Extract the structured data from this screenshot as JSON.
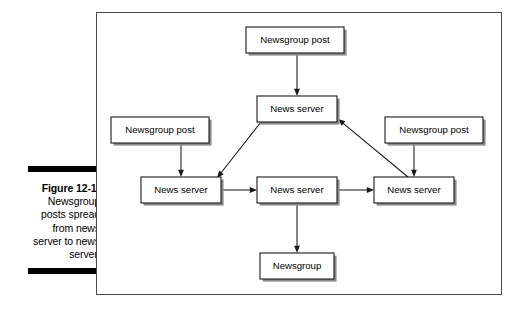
{
  "page": {
    "background_color": "#ffffff",
    "ink_color": "#000000"
  },
  "caption": {
    "figure_number": "Figure 12-1:",
    "body": "Newsgroup posts spread from news server to news server.",
    "rule_color": "#000000"
  },
  "figure": {
    "frame_border_color": "#4a4a4a",
    "box_fill": "#ffffff",
    "box_border_color": "#1a1a1a",
    "box_shadow_color": "#8c8c8c",
    "edge_color": "#1a1a1a"
  },
  "diagram": {
    "type": "flow-diagram",
    "nodes": [
      {
        "id": "post-top",
        "label": "Newsgroup post",
        "x": 149,
        "y": 14,
        "w": 98,
        "h": 26
      },
      {
        "id": "server-top",
        "label": "News server",
        "x": 160,
        "y": 83,
        "w": 80,
        "h": 26
      },
      {
        "id": "post-left",
        "label": "Newsgroup post",
        "x": 14,
        "y": 104,
        "w": 98,
        "h": 26
      },
      {
        "id": "post-right",
        "label": "Newsgroup post",
        "x": 288,
        "y": 104,
        "w": 98,
        "h": 26
      },
      {
        "id": "server-left",
        "label": "News server",
        "x": 44,
        "y": 164,
        "w": 80,
        "h": 26
      },
      {
        "id": "server-middle",
        "label": "News server",
        "x": 160,
        "y": 164,
        "w": 80,
        "h": 26
      },
      {
        "id": "server-right",
        "label": "News server",
        "x": 277,
        "y": 164,
        "w": 80,
        "h": 26
      },
      {
        "id": "newsgroup",
        "label": "Newsgroup",
        "x": 163,
        "y": 240,
        "w": 74,
        "h": 26
      }
    ],
    "edges": [
      {
        "id": "post-top-to-server-top",
        "from": "post-top",
        "to": "server-top",
        "kind": "vertical"
      },
      {
        "id": "post-left-to-server-left",
        "from": "post-left",
        "to": "server-left",
        "kind": "vertical"
      },
      {
        "id": "post-right-to-server-right",
        "from": "post-right",
        "to": "server-right",
        "kind": "vertical"
      },
      {
        "id": "server-top-to-server-left",
        "from": "server-top",
        "to": "server-left",
        "kind": "diagonal"
      },
      {
        "id": "server-right-to-server-top",
        "from": "server-right",
        "to": "server-top",
        "kind": "diagonal"
      },
      {
        "id": "server-left-to-server-middle",
        "from": "server-left",
        "to": "server-middle",
        "kind": "horizontal"
      },
      {
        "id": "server-middle-to-server-right",
        "from": "server-middle",
        "to": "server-right",
        "kind": "horizontal"
      },
      {
        "id": "server-middle-to-newsgroup",
        "from": "server-middle",
        "to": "newsgroup",
        "kind": "vertical"
      }
    ]
  }
}
